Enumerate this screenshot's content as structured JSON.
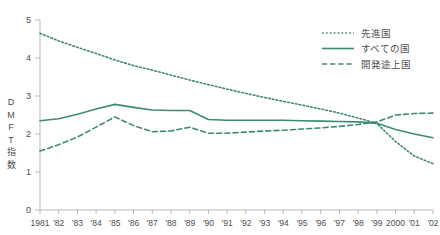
{
  "chart_data": {
    "type": "line",
    "title": "",
    "subtitle": "",
    "xlabel": "",
    "ylabel": "DMFT指数",
    "ylabel_chars": [
      "D",
      "M",
      "F",
      "T",
      "指",
      "数"
    ],
    "ylim": [
      0,
      5
    ],
    "yticks": [
      0,
      1,
      2,
      3,
      4,
      5
    ],
    "ytick_labels": [
      "0",
      "1",
      "2",
      "3",
      "4",
      "5"
    ],
    "grid": false,
    "legend_position": "top-right",
    "accent_color": "#3d8a73",
    "axis_color": "#b9b9b9",
    "text_color": "#4d4d4d",
    "categories": [
      "1981",
      "1982",
      "1983",
      "1984",
      "1985",
      "1986",
      "1987",
      "1988",
      "1989",
      "1990",
      "1991",
      "1992",
      "1993",
      "1994",
      "1995",
      "1996",
      "1997",
      "1998",
      "1999",
      "2000",
      "2001",
      "2002"
    ],
    "xtick_labels": [
      "1981",
      "'82",
      "'83",
      "'84",
      "'85",
      "'86",
      "'87",
      "'88",
      "'89",
      "'90",
      "'91",
      "'92",
      "'93",
      "'94",
      "'95",
      "'96",
      "'97",
      "'98",
      "'99",
      "2000",
      "'01",
      "'02"
    ],
    "series": [
      {
        "name": "先進国",
        "style": "dotted",
        "color": "#3d8a73",
        "values": [
          4.65,
          4.45,
          4.28,
          4.12,
          3.95,
          3.8,
          3.68,
          3.55,
          3.42,
          3.3,
          3.18,
          3.07,
          2.96,
          2.86,
          2.76,
          2.66,
          2.55,
          2.42,
          2.28,
          1.8,
          1.42,
          1.22
        ]
      },
      {
        "name": "すべての国",
        "style": "solid",
        "color": "#3d8a73",
        "values": [
          2.35,
          2.4,
          2.52,
          2.66,
          2.78,
          2.7,
          2.63,
          2.62,
          2.62,
          2.38,
          2.36,
          2.36,
          2.36,
          2.36,
          2.35,
          2.34,
          2.33,
          2.32,
          2.28,
          2.12,
          2.0,
          1.9
        ]
      },
      {
        "name": "開発途上国",
        "style": "dashed",
        "color": "#3d8a73",
        "values": [
          1.55,
          1.72,
          1.92,
          2.18,
          2.45,
          2.22,
          2.06,
          2.08,
          2.18,
          2.02,
          2.02,
          2.05,
          2.08,
          2.1,
          2.13,
          2.16,
          2.2,
          2.25,
          2.32,
          2.5,
          2.54,
          2.55
        ]
      }
    ]
  }
}
